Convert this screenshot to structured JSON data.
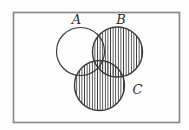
{
  "figure": {
    "type": "venn-diagram",
    "sets": [
      {
        "label": "A",
        "shaded": false
      },
      {
        "label": "B",
        "shaded": true
      },
      {
        "label": "C",
        "shaded": true
      }
    ],
    "shaded_region": "B ∪ C",
    "shading_style": "vertical-hatch",
    "colors": {
      "background": "#fefefe",
      "frame": "#8b8b8b",
      "outline": "#3c3c3c",
      "hatch": "#3f3f3f"
    }
  }
}
